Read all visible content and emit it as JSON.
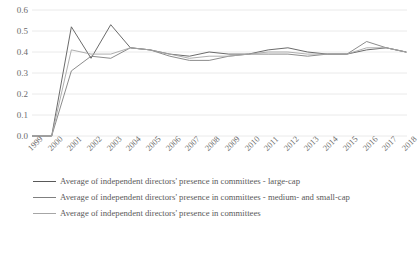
{
  "chart_data": {
    "type": "line",
    "title": "",
    "xlabel": "",
    "ylabel": "",
    "ylim": [
      0,
      0.6
    ],
    "ytick_step": 0.1,
    "grid": true,
    "legend_position": "bottom-left",
    "categories": [
      "1999",
      "2000",
      "2001",
      "2002",
      "2003",
      "2004",
      "2005",
      "2006",
      "2007",
      "2008",
      "2009",
      "2010",
      "2011",
      "2012",
      "2013",
      "2014",
      "2015",
      "2016",
      "2017",
      "2018"
    ],
    "y_ticks": [
      "0.0",
      "0.1",
      "0.2",
      "0.3",
      "0.4",
      "0.5",
      "0.6"
    ],
    "series": [
      {
        "name": "Average of independent directors' presence in committees - large-cap",
        "color": "#595959",
        "values": [
          0.0,
          0.0,
          0.52,
          0.37,
          0.53,
          0.42,
          0.41,
          0.39,
          0.38,
          0.4,
          0.39,
          0.39,
          0.41,
          0.42,
          0.4,
          0.39,
          0.39,
          0.41,
          0.42,
          0.4
        ]
      },
      {
        "name": "Average of independent directors' presence in committees - medium- and small-cap",
        "color": "#7f7f7f",
        "values": [
          0.0,
          0.0,
          0.31,
          0.38,
          0.37,
          0.42,
          0.41,
          0.38,
          0.36,
          0.36,
          0.38,
          0.39,
          0.39,
          0.39,
          0.38,
          0.39,
          0.39,
          0.45,
          0.42,
          0.4
        ]
      },
      {
        "name": "Average of independent directors' presence in committees",
        "color": "#a6a6a6",
        "values": [
          0.0,
          0.0,
          0.41,
          0.39,
          0.39,
          0.42,
          0.41,
          0.39,
          0.37,
          0.38,
          0.38,
          0.39,
          0.4,
          0.4,
          0.39,
          0.39,
          0.39,
          0.42,
          0.42,
          0.4
        ]
      }
    ]
  },
  "legend": {
    "items": [
      {
        "label": "Average of independent directors' presence in committees - large-cap"
      },
      {
        "label": "Average of independent directors' presence in committees - medium- and small-cap"
      },
      {
        "label": "Average of independent directors' presence in committees"
      }
    ]
  }
}
